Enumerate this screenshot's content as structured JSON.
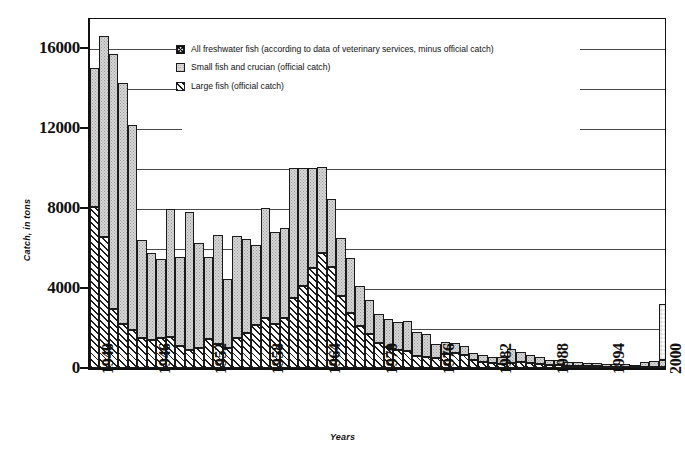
{
  "chart_data": {
    "type": "bar",
    "title": "",
    "subtitle": "",
    "xlabel": "Years",
    "ylabel": "Catch, in tons",
    "ylim": [
      0,
      17500
    ],
    "yticks": [
      0,
      4000,
      8000,
      12000,
      16000
    ],
    "ytick_labels": [
      "0",
      "4000",
      "8000",
      "12000",
      "16000"
    ],
    "gridlines": [
      2000,
      4000,
      6000,
      8000,
      10000,
      12000,
      14000,
      16000
    ],
    "grid": true,
    "stacked": true,
    "legend_position": "top-center-inside",
    "xtick_labels": [
      "1940",
      "1946",
      "1952",
      "1958",
      "1964",
      "1970",
      "1976",
      "1982",
      "1988",
      "1994",
      "2000"
    ],
    "xtick_step": 6,
    "x": [
      1940,
      1941,
      1942,
      1943,
      1944,
      1945,
      1946,
      1947,
      1948,
      1949,
      1950,
      1951,
      1952,
      1953,
      1954,
      1955,
      1956,
      1957,
      1958,
      1959,
      1960,
      1961,
      1962,
      1963,
      1964,
      1965,
      1966,
      1967,
      1968,
      1969,
      1970,
      1971,
      1972,
      1973,
      1974,
      1975,
      1976,
      1977,
      1978,
      1979,
      1980,
      1981,
      1982,
      1983,
      1984,
      1985,
      1986,
      1987,
      1988,
      1989,
      1990,
      1991,
      1992,
      1993,
      1994,
      1995,
      1996,
      1997,
      1998,
      1999,
      2000
    ],
    "series": [
      {
        "name": "Large fish (official catch)",
        "key": "large",
        "pattern": "diagonal-hatch",
        "values": [
          8050,
          6550,
          2950,
          2200,
          1900,
          1500,
          1400,
          1500,
          1550,
          1100,
          900,
          1000,
          1450,
          1200,
          1000,
          1500,
          1750,
          2150,
          2500,
          2200,
          2500,
          3500,
          4100,
          5000,
          5750,
          5050,
          3600,
          2750,
          2100,
          1700,
          1250,
          1050,
          900,
          850,
          600,
          550,
          500,
          700,
          750,
          650,
          400,
          300,
          250,
          200,
          250,
          300,
          250,
          200,
          150,
          150,
          120,
          100,
          90,
          80,
          70,
          60,
          60,
          50,
          50,
          50,
          50
        ]
      },
      {
        "name": "Small fish and crucian (official catch)",
        "key": "small",
        "pattern": "dotted-gray",
        "values": [
          6950,
          10050,
          12750,
          12050,
          10250,
          4900,
          4350,
          3950,
          6400,
          4450,
          6900,
          5250,
          4100,
          5450,
          3450,
          5100,
          4700,
          4000,
          5500,
          4600,
          4500,
          6500,
          5900,
          5000,
          4300,
          3400,
          2900,
          2750,
          2000,
          1700,
          1450,
          1400,
          1400,
          1500,
          1200,
          1150,
          700,
          600,
          500,
          450,
          350,
          350,
          300,
          350,
          700,
          500,
          400,
          350,
          250,
          250,
          200,
          180,
          160,
          150,
          130,
          120,
          120,
          110,
          250,
          300,
          350
        ]
      },
      {
        "name": "All freshwater fish (according to data of veterinary services, minus official catch)",
        "key": "all",
        "pattern": "checkered",
        "values": [
          0,
          0,
          0,
          0,
          0,
          0,
          0,
          0,
          0,
          0,
          0,
          0,
          0,
          0,
          0,
          0,
          0,
          0,
          0,
          0,
          0,
          0,
          0,
          0,
          0,
          0,
          0,
          0,
          0,
          0,
          0,
          0,
          0,
          0,
          0,
          0,
          0,
          0,
          0,
          0,
          0,
          0,
          0,
          0,
          0,
          0,
          0,
          0,
          0,
          0,
          0,
          0,
          0,
          0,
          0,
          0,
          0,
          0,
          0,
          0,
          2800
        ]
      }
    ],
    "totals": [
      15000,
      16600,
      15700,
      14250,
      12150,
      6400,
      5750,
      5450,
      7950,
      5550,
      7800,
      6250,
      5550,
      6650,
      4450,
      6600,
      6450,
      6150,
      8000,
      6800,
      7000,
      10000,
      10000,
      10000,
      10050,
      8450,
      6500,
      5500,
      4100,
      3400,
      2700,
      2450,
      2300,
      2350,
      1800,
      1700,
      1200,
      1300,
      1250,
      1100,
      750,
      650,
      550,
      550,
      950,
      800,
      650,
      550,
      400,
      400,
      320,
      280,
      250,
      230,
      200,
      180,
      180,
      160,
      300,
      350,
      3200
    ]
  },
  "legend": {
    "items": [
      {
        "swatch": "all",
        "label": "All freshwater fish (according to data of veterinary services, minus official catch)"
      },
      {
        "swatch": "small",
        "label": "Small fish and crucian (official catch)"
      },
      {
        "swatch": "large",
        "label": "Large fish (official catch)"
      }
    ]
  },
  "colors": {
    "axis": "#111111",
    "grid": "#4a4a4a",
    "small_fill": "#d6d6d6",
    "large_fill": "#ffffff",
    "background": "#ffffff"
  }
}
